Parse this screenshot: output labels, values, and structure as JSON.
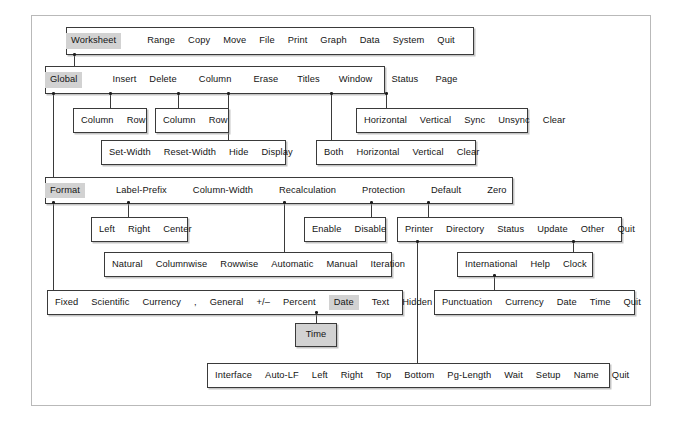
{
  "diagram": {
    "highlight_color": "#d2d2d2",
    "line_color": "#3a3a3a",
    "frame_color": "#b9b9b9"
  },
  "rows": {
    "main_menu": {
      "name": "worksheet-main-menu",
      "items": [
        {
          "label": "Worksheet",
          "highlighted": true
        },
        {
          "label": "Range",
          "highlighted": false
        },
        {
          "label": "Copy",
          "highlighted": false
        },
        {
          "label": "Move",
          "highlighted": false
        },
        {
          "label": "File",
          "highlighted": false
        },
        {
          "label": "Print",
          "highlighted": false
        },
        {
          "label": "Graph",
          "highlighted": false
        },
        {
          "label": "Data",
          "highlighted": false
        },
        {
          "label": "System",
          "highlighted": false
        },
        {
          "label": "Quit",
          "highlighted": false
        }
      ]
    },
    "worksheet_menu": {
      "name": "worksheet-submenu",
      "items": [
        {
          "label": "Global",
          "highlighted": true
        },
        {
          "label": "Insert",
          "highlighted": false
        },
        {
          "label": "Delete",
          "highlighted": false
        },
        {
          "label": "Column",
          "highlighted": false
        },
        {
          "label": "Erase",
          "highlighted": false
        },
        {
          "label": "Titles",
          "highlighted": false
        },
        {
          "label": "Window",
          "highlighted": false
        },
        {
          "label": "Status",
          "highlighted": false
        },
        {
          "label": "Page",
          "highlighted": false
        }
      ]
    },
    "insert_menu": {
      "name": "insert-submenu",
      "items": [
        {
          "label": "Column"
        },
        {
          "label": "Row"
        }
      ]
    },
    "delete_menu": {
      "name": "delete-submenu",
      "items": [
        {
          "label": "Column"
        },
        {
          "label": "Row"
        }
      ]
    },
    "window_menu": {
      "name": "window-submenu",
      "items": [
        {
          "label": "Horizontal"
        },
        {
          "label": "Vertical"
        },
        {
          "label": "Sync"
        },
        {
          "label": "Unsync"
        },
        {
          "label": "Clear"
        }
      ]
    },
    "column_menu": {
      "name": "column-submenu",
      "items": [
        {
          "label": "Set-Width"
        },
        {
          "label": "Reset-Width"
        },
        {
          "label": "Hide"
        },
        {
          "label": "Display"
        }
      ]
    },
    "titles_menu": {
      "name": "titles-submenu",
      "items": [
        {
          "label": "Both"
        },
        {
          "label": "Horizontal"
        },
        {
          "label": "Vertical"
        },
        {
          "label": "Clear"
        }
      ]
    },
    "global_menu": {
      "name": "global-submenu",
      "items": [
        {
          "label": "Format",
          "highlighted": true
        },
        {
          "label": "Label-Prefix",
          "highlighted": false
        },
        {
          "label": "Column-Width",
          "highlighted": false
        },
        {
          "label": "Recalculation",
          "highlighted": false
        },
        {
          "label": "Protection",
          "highlighted": false
        },
        {
          "label": "Default",
          "highlighted": false
        },
        {
          "label": "Zero",
          "highlighted": false
        }
      ]
    },
    "label_prefix_menu": {
      "name": "label-prefix-submenu",
      "items": [
        {
          "label": "Left"
        },
        {
          "label": "Right"
        },
        {
          "label": "Center"
        }
      ]
    },
    "protection_menu": {
      "name": "protection-submenu",
      "items": [
        {
          "label": "Enable"
        },
        {
          "label": "Disable"
        }
      ]
    },
    "default_menu": {
      "name": "default-submenu",
      "items": [
        {
          "label": "Printer"
        },
        {
          "label": "Directory"
        },
        {
          "label": "Status"
        },
        {
          "label": "Update"
        },
        {
          "label": "Other"
        },
        {
          "label": "Quit"
        }
      ]
    },
    "recalculation_menu": {
      "name": "recalculation-submenu",
      "items": [
        {
          "label": "Natural"
        },
        {
          "label": "Columnwise"
        },
        {
          "label": "Rowwise"
        },
        {
          "label": "Automatic"
        },
        {
          "label": "Manual"
        },
        {
          "label": "Iteration"
        }
      ]
    },
    "other_menu": {
      "name": "other-submenu",
      "items": [
        {
          "label": "International"
        },
        {
          "label": "Help"
        },
        {
          "label": "Clock"
        }
      ]
    },
    "format_menu": {
      "name": "format-submenu",
      "items": [
        {
          "label": "Fixed",
          "highlighted": false
        },
        {
          "label": "Scientific",
          "highlighted": false
        },
        {
          "label": "Currency",
          "highlighted": false
        },
        {
          "label": ",",
          "highlighted": false
        },
        {
          "label": "General",
          "highlighted": false
        },
        {
          "label": "+/–",
          "highlighted": false
        },
        {
          "label": "Percent",
          "highlighted": false
        },
        {
          "label": "Date",
          "highlighted": true
        },
        {
          "label": "Text",
          "highlighted": false
        },
        {
          "label": "Hidden",
          "highlighted": false
        }
      ]
    },
    "international_menu": {
      "name": "international-submenu",
      "items": [
        {
          "label": "Punctuation"
        },
        {
          "label": "Currency"
        },
        {
          "label": "Date"
        },
        {
          "label": "Time"
        },
        {
          "label": "Quit"
        }
      ]
    },
    "date_menu": {
      "name": "date-submenu",
      "items": [
        {
          "label": "Time",
          "highlighted": true
        }
      ]
    },
    "printer_menu": {
      "name": "printer-submenu",
      "items": [
        {
          "label": "Interface"
        },
        {
          "label": "Auto-LF"
        },
        {
          "label": "Left"
        },
        {
          "label": "Right"
        },
        {
          "label": "Top"
        },
        {
          "label": "Bottom"
        },
        {
          "label": "Pg-Length"
        },
        {
          "label": "Wait"
        },
        {
          "label": "Setup"
        },
        {
          "label": "Name"
        },
        {
          "label": "Quit"
        }
      ]
    }
  }
}
